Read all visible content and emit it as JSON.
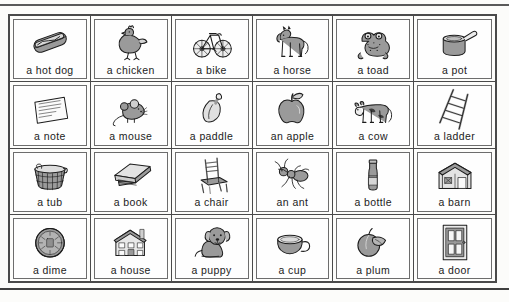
{
  "worksheet": {
    "kind": "picture-vocabulary-grid",
    "columns": 6,
    "rows": 4,
    "border_color": "#4a4a4a",
    "page_color": "#fcfcfa",
    "art_fill": "#9a9a9a",
    "art_line": "#1c1c1c",
    "rules": {
      "top": true,
      "bottom": true
    }
  },
  "cells": [
    {
      "label": "a hot dog",
      "icon": "hot-dog-icon"
    },
    {
      "label": "a chicken",
      "icon": "chicken-icon"
    },
    {
      "label": "a bike",
      "icon": "bike-icon"
    },
    {
      "label": "a horse",
      "icon": "horse-icon"
    },
    {
      "label": "a toad",
      "icon": "toad-icon"
    },
    {
      "label": "a pot",
      "icon": "pot-icon"
    },
    {
      "label": "a note",
      "icon": "note-icon"
    },
    {
      "label": "a mouse",
      "icon": "mouse-icon"
    },
    {
      "label": "a paddle",
      "icon": "paddle-icon"
    },
    {
      "label": "an apple",
      "icon": "apple-icon"
    },
    {
      "label": "a cow",
      "icon": "cow-icon"
    },
    {
      "label": "a ladder",
      "icon": "ladder-icon"
    },
    {
      "label": "a tub",
      "icon": "tub-icon"
    },
    {
      "label": "a book",
      "icon": "book-icon"
    },
    {
      "label": "a chair",
      "icon": "chair-icon"
    },
    {
      "label": "an ant",
      "icon": "ant-icon"
    },
    {
      "label": "a bottle",
      "icon": "bottle-icon"
    },
    {
      "label": "a barn",
      "icon": "barn-icon"
    },
    {
      "label": "a dime",
      "icon": "dime-icon"
    },
    {
      "label": "a house",
      "icon": "house-icon"
    },
    {
      "label": "a puppy",
      "icon": "puppy-icon"
    },
    {
      "label": "a cup",
      "icon": "cup-icon"
    },
    {
      "label": "a plum",
      "icon": "plum-icon"
    },
    {
      "label": "a door",
      "icon": "door-icon"
    }
  ]
}
